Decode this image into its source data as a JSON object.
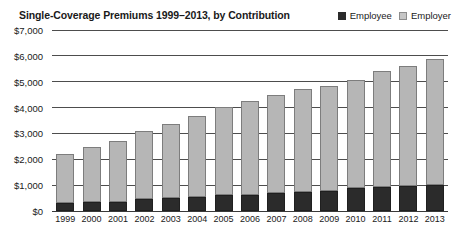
{
  "header": {
    "title": "Single-Coverage Premiums 1999–2013, by Contribution"
  },
  "legend": {
    "items": [
      {
        "label": "Employee",
        "color": "#2b2b2b",
        "swatch": "filled-square-icon"
      },
      {
        "label": "Employer",
        "color": "#c6c6c6",
        "swatch": "outlined-square-icon"
      }
    ]
  },
  "colors": {
    "employee": "#2b2b2b",
    "employer": "#b6b6b6",
    "employer_border": "#7d7d7d",
    "gridline": "#4d4d4d",
    "text": "#1a1a1a",
    "background": "#ffffff"
  },
  "chart_data": {
    "type": "bar",
    "subtype": "stacked-column",
    "title": "Single-Coverage Premiums 1999–2013, by Contribution",
    "xlabel": "",
    "ylabel": "",
    "ylim": [
      0,
      7000
    ],
    "ytick_step": 1000,
    "yticks": [
      0,
      1000,
      2000,
      3000,
      4000,
      5000,
      6000,
      7000
    ],
    "ytick_labels": [
      "$0",
      "$1,000",
      "$2,000",
      "$3,000",
      "$4,000",
      "$5,000",
      "$6,000",
      "$7,000"
    ],
    "grid": true,
    "legend_position": "top-right",
    "categories": [
      "1999",
      "2000",
      "2001",
      "2002",
      "2003",
      "2004",
      "2005",
      "2006",
      "2007",
      "2008",
      "2009",
      "2010",
      "2011",
      "2012",
      "2013"
    ],
    "series": [
      {
        "name": "Employee",
        "color": "#2b2b2b",
        "values": [
          318,
          334,
          355,
          466,
          508,
          558,
          610,
          627,
          694,
          721,
          779,
          899,
          921,
          951,
          999
        ]
      },
      {
        "name": "Employer",
        "color": "#b6b6b6",
        "values": [
          1878,
          2137,
          2334,
          2617,
          2875,
          3136,
          3413,
          3615,
          3785,
          3983,
          4045,
          4150,
          4508,
          4664,
          4885
        ]
      }
    ],
    "totals": [
      2196,
      2471,
      2689,
      3083,
      3383,
      3695,
      4024,
      4242,
      4479,
      4704,
      4824,
      5049,
      5429,
      5615,
      5884
    ]
  }
}
